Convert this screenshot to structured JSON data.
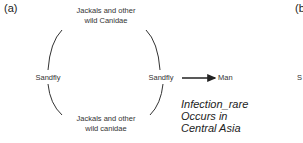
{
  "panels": {
    "a_label": "(a)",
    "b_label": "(b"
  },
  "cycle": {
    "top_node": {
      "line1": "Jackals and other",
      "line2": "wild Canidae"
    },
    "left_node": "Sandfly",
    "right_node": "Sandfly",
    "bottom_node": {
      "line1": "Jackals and other",
      "line2": "wild canidae"
    }
  },
  "arrow": {
    "target": "Man"
  },
  "note": {
    "line1": "Infection_rare",
    "line2": "Occurs in",
    "line3": "Central Asia"
  },
  "cut_off_right": {
    "partial_text": "S"
  },
  "colors": {
    "line": "#333333",
    "text": "#222222"
  }
}
